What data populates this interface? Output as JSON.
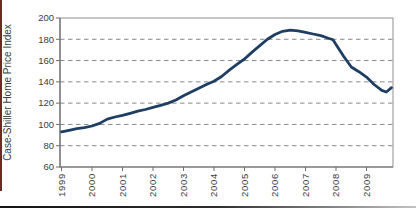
{
  "figure": {
    "background": "#ffffff",
    "left_accent_rule_color": "#6e2b24",
    "bottom_rule_gradient_start": "#141414",
    "bottom_rule_gradient_mid": "#2e2e2e",
    "bottom_rule_gradient_end": "#c2c2c2"
  },
  "chart_data": {
    "type": "line",
    "title": "",
    "xlabel": "",
    "ylabel": "Case-Shiller Home Price Index",
    "legend": "none",
    "grid": "horizontal-dashed",
    "x_base": 1999,
    "xlim": [
      1999,
      2009.85
    ],
    "ylim": [
      60,
      200
    ],
    "x_ticks": [
      1999,
      2000,
      2001,
      2002,
      2003,
      2004,
      2005,
      2006,
      2007,
      2008,
      2009
    ],
    "y_ticks": [
      60,
      80,
      100,
      120,
      140,
      160,
      180,
      200
    ],
    "line_color": "#1e3f63",
    "grid_color": "#8a8a8a",
    "axis_color": "#6e6e6e",
    "frame_color": "#8f8f8f",
    "text_color": "#3d3d3d",
    "series": [
      {
        "name": "Case-Shiller Home Price Index",
        "x": [
          1999,
          1999.25,
          1999.5,
          1999.75,
          2000,
          2000.25,
          2000.5,
          2000.75,
          2001,
          2001.25,
          2001.5,
          2001.75,
          2002,
          2002.25,
          2002.5,
          2002.75,
          2003,
          2003.25,
          2003.5,
          2003.75,
          2004,
          2004.25,
          2004.5,
          2004.75,
          2005,
          2005.25,
          2005.5,
          2005.75,
          2006,
          2006.25,
          2006.5,
          2006.75,
          2007,
          2007.25,
          2007.5,
          2007.75,
          2007.9,
          2008,
          2008.25,
          2008.5,
          2008.75,
          2009,
          2009.25,
          2009.5,
          2009.65,
          2009.82
        ],
        "values": [
          93,
          94.5,
          96,
          97,
          98.5,
          101,
          105,
          107,
          108.5,
          110.5,
          112.5,
          114,
          116,
          118,
          120,
          123,
          127,
          130.5,
          134,
          137.5,
          140.5,
          145,
          151,
          156.5,
          161.5,
          168,
          174,
          180,
          184.5,
          187.5,
          188.5,
          188,
          186.5,
          185,
          183.5,
          181,
          179.5,
          175,
          164,
          154,
          149.5,
          144.5,
          137.5,
          132,
          130.5,
          134.5
        ]
      }
    ]
  }
}
